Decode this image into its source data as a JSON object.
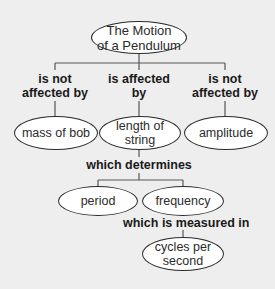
{
  "diagram": {
    "type": "concept-map",
    "background": "#eeeeee",
    "root": {
      "label_line1": "The Motion",
      "label_line2": "of a Pendulum"
    },
    "links": {
      "left": {
        "line1": "is not",
        "line2": "affected by"
      },
      "middle": {
        "line1": "is affected",
        "line2": "by"
      },
      "right": {
        "line1": "is not",
        "line2": "affected by"
      },
      "determines": "which determines",
      "measured": "which is measured in"
    },
    "nodes": {
      "mass_of_bob": "mass of bob",
      "length_of_string": "length of string",
      "amplitude": "amplitude",
      "period": "period",
      "frequency": "frequency",
      "cycles_line1": "cycles per",
      "cycles_line2": "second"
    },
    "edges": [
      {
        "from": "The Motion of a Pendulum",
        "label": "is not affected by",
        "to": "mass of bob"
      },
      {
        "from": "The Motion of a Pendulum",
        "label": "is affected by",
        "to": "length of string"
      },
      {
        "from": "The Motion of a Pendulum",
        "label": "is not affected by",
        "to": "amplitude"
      },
      {
        "from": "length of string",
        "label": "which determines",
        "to": "period"
      },
      {
        "from": "length of string",
        "label": "which determines",
        "to": "frequency"
      },
      {
        "from": "frequency",
        "label": "which is measured in",
        "to": "cycles per second"
      }
    ]
  }
}
